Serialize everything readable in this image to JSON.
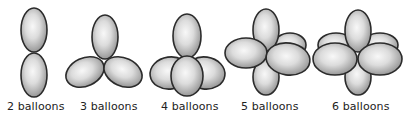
{
  "figure": {
    "title": "",
    "groups": [
      {
        "label": "2 balloons",
        "count": 2
      },
      {
        "label": "3 balloons",
        "count": 3
      },
      {
        "label": "4 balloons",
        "count": 4
      },
      {
        "label": "5 balloons",
        "count": 5
      },
      {
        "label": "6 balloons",
        "count": 6
      }
    ],
    "colors": {
      "balloon_highlight": "#f7f7f7",
      "balloon_shade": "#9c9c9c",
      "outline": "#2b2b2b",
      "label_text": "#222222",
      "background": "#ffffff"
    }
  }
}
